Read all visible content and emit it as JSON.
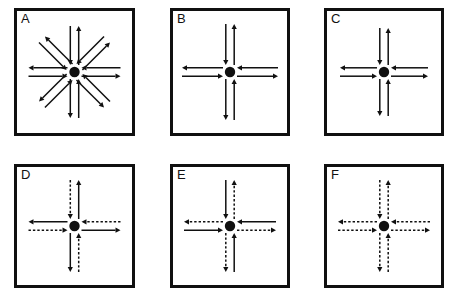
{
  "figure": {
    "background_color": "#ffffff",
    "ink_color": "#101010",
    "width": 454,
    "height": 292,
    "rows": 2,
    "columns": 3
  },
  "chart_data": {
    "type": "diagram",
    "title": "",
    "panels": [
      {
        "label": "A",
        "directions": 8,
        "direction_names": [
          "north",
          "northeast",
          "east",
          "southeast",
          "south",
          "southwest",
          "west",
          "northwest"
        ],
        "arrows_per_direction": 2,
        "outbound_style": "solid",
        "inbound_style": "solid",
        "arm_length": 46,
        "center_dot": true
      },
      {
        "label": "B",
        "directions": 4,
        "direction_names": [
          "north",
          "east",
          "south",
          "west"
        ],
        "arrows_per_direction": 2,
        "outbound_style": "solid",
        "inbound_style": "solid",
        "arm_length": 48,
        "center_dot": true
      },
      {
        "label": "C",
        "directions": 4,
        "direction_names": [
          "north",
          "east",
          "south",
          "west"
        ],
        "arrows_per_direction": 2,
        "outbound_style": "solid",
        "inbound_style": "solid",
        "arm_length": 44,
        "center_dot": true
      },
      {
        "label": "D",
        "directions": 4,
        "direction_names": [
          "north",
          "east",
          "south",
          "west"
        ],
        "arrows_per_direction": 2,
        "outbound_style": "solid",
        "inbound_style": "dashed",
        "arm_length": 46,
        "center_dot": true
      },
      {
        "label": "E",
        "directions": 4,
        "direction_names": [
          "north",
          "east",
          "south",
          "west"
        ],
        "arrows_per_direction": 2,
        "outbound_style": "dashed",
        "inbound_style": "solid",
        "arm_length": 46,
        "center_dot": true
      },
      {
        "label": "F",
        "directions": 4,
        "direction_names": [
          "north",
          "east",
          "south",
          "west"
        ],
        "arrows_per_direction": 2,
        "outbound_style": "dashed",
        "inbound_style": "dashed",
        "arm_length": 46,
        "center_dot": true
      }
    ],
    "legend": [],
    "xlabel": "",
    "ylabel": ""
  },
  "layout": {
    "panel_boxes": [
      {
        "label": "A",
        "x": 14,
        "y": 8,
        "w": 121,
        "h": 128
      },
      {
        "label": "B",
        "x": 170,
        "y": 8,
        "w": 120,
        "h": 128
      },
      {
        "label": "C",
        "x": 324,
        "y": 8,
        "w": 120,
        "h": 128
      },
      {
        "label": "D",
        "x": 14,
        "y": 164,
        "w": 121,
        "h": 124
      },
      {
        "label": "E",
        "x": 170,
        "y": 164,
        "w": 120,
        "h": 124
      },
      {
        "label": "F",
        "x": 324,
        "y": 164,
        "w": 120,
        "h": 124
      }
    ]
  }
}
